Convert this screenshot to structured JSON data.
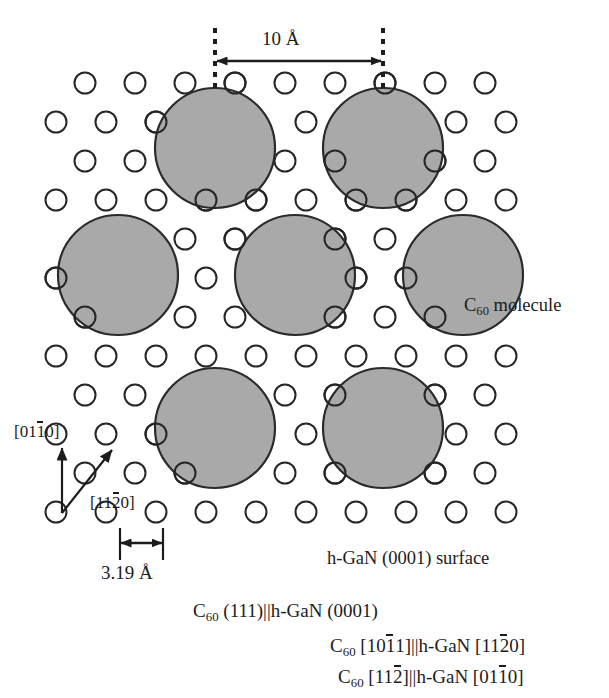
{
  "figure": {
    "type": "crystal-structure-schematic"
  },
  "colors": {
    "molecule_fill": "#a9a9a9",
    "molecule_stroke": "#2b2b2b",
    "atom_stroke": "#262626",
    "atom_fill": "#ffffff",
    "annotation": "#1c1c1c",
    "background": "#ffffff"
  },
  "annotations": {
    "spacing_top": "10 Å",
    "spacing_lattice": "3.19 Å",
    "molecule_label_c": "C",
    "molecule_label_sub": "60",
    "molecule_label_rest": " molecule",
    "surface_label": "h-GaN (0001) surface"
  },
  "directions": {
    "vertical": {
      "pre": "[01",
      "over": "1",
      "post": "0]"
    },
    "diagonal": {
      "pre": "[11",
      "over": "2",
      "post": "0]"
    }
  },
  "epitaxy": [
    {
      "left": {
        "sym": "C",
        "sub": "60",
        "rest": " (111)"
      },
      "sep": "||",
      "right": {
        "rest": "h-GaN (0001)"
      }
    },
    {
      "left": {
        "sym": "C",
        "sub": "60",
        "pre": " [10",
        "over": "1",
        "post": "1]"
      },
      "sep": "||",
      "right": {
        "pre": "h-GaN [11",
        "over": "2",
        "post": "0]"
      }
    },
    {
      "left": {
        "sym": "C",
        "sub": "60",
        "pre": " [11",
        "over": "2",
        "post": "]"
      },
      "sep": "||",
      "right": {
        "pre": "h-GaN [01",
        "over": "1",
        "post": "0]"
      }
    }
  ],
  "lattice": {
    "atom_radius": 10.5,
    "row_spacing": 39,
    "col_spacing": 50,
    "row_offset": 29,
    "rows_y": [
      83,
      122,
      161,
      200,
      239,
      278,
      317,
      356,
      395,
      434,
      473,
      512
    ],
    "row_start_x": [
      85,
      56,
      85,
      56,
      85,
      56,
      85,
      56,
      85,
      56,
      85,
      56
    ],
    "row_counts": [
      9,
      10,
      9,
      10,
      9,
      10,
      9,
      10,
      9,
      10,
      9,
      10
    ]
  },
  "molecules": {
    "radius": 60,
    "positions": [
      {
        "cx": 215,
        "cy": 148
      },
      {
        "cx": 383,
        "cy": 148
      },
      {
        "cx": 118,
        "cy": 275
      },
      {
        "cx": 295,
        "cy": 275
      },
      {
        "cx": 463,
        "cy": 275
      },
      {
        "cx": 215,
        "cy": 428
      },
      {
        "cx": 383,
        "cy": 428
      }
    ]
  },
  "measure_top": {
    "dash_x_left": 215,
    "dash_x_right": 383,
    "dash_y_top": 28,
    "dash_y_bottom": 90,
    "arrow_y": 61
  },
  "measure_lattice": {
    "tick_x_left": 120,
    "tick_x_right": 163,
    "tick_y_top": 528,
    "tick_y_bottom": 560,
    "arrow_y": 543
  },
  "direction_arrows": {
    "origin_x": 62,
    "origin_y": 513,
    "vertical_tip_y": 448,
    "diagonal_tip_x": 112,
    "diagonal_tip_y": 450
  }
}
